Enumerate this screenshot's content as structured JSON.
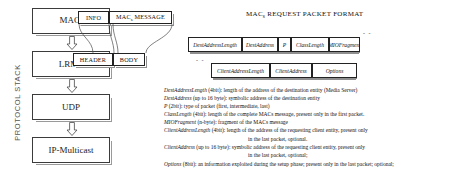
{
  "protocol_stack": {
    "axis_label": "PROTOCOL STACK",
    "nodes": [
      {
        "label": "MACs",
        "base": "MAC",
        "sub": "s"
      },
      {
        "label": "LRMP",
        "base": "LRMP",
        "sub": ""
      },
      {
        "label": "UDP",
        "base": "UDP",
        "sub": ""
      },
      {
        "label": "IP-Multicast",
        "base": "IP-Multicast",
        "sub": ""
      }
    ]
  },
  "message_boxes": {
    "info": "INFO",
    "macs_message_base": "MAC",
    "macs_message_sub": "s",
    "macs_message_tail": " MESSAGE",
    "header": "HEADER",
    "body": "BODY"
  },
  "packet_format": {
    "title_base": "MAC",
    "title_sub": "s",
    "title_tail": " REQUEST PACKET FORMAT",
    "row1": [
      "DestAddressLength",
      "DestAddress",
      "P",
      "ClassLength",
      "MIOFragment"
    ],
    "row2": [
      "ClientAddressLength",
      "ClientAddress",
      "Options"
    ],
    "continuation_marker": "- -"
  },
  "legend": [
    {
      "term": "DestAddressLength",
      "desc": " (4bit): length of the address of the destination entity (Media Server)",
      "cont": ""
    },
    {
      "term": "DestAddress",
      "desc": " (up to 16 byte): symbolic address of the destination entity",
      "cont": ""
    },
    {
      "term": "P",
      "desc": " (2bit): type of packet (first, intermediate, last)",
      "cont": ""
    },
    {
      "term": "ClassLength",
      "desc": " (4bit): length of the complete MACs message, present only in the first packet.",
      "cont": ""
    },
    {
      "term": "MIOFragment",
      "desc": " (n-byte): fragment of the MACs message",
      "cont": ""
    },
    {
      "term": "ClientAddressLength",
      "desc": " (4bit): length of the address of the requesting client entity, present only",
      "cont": "in the last packet, optional."
    },
    {
      "term": "ClientAddress",
      "desc": " (up to 16 byte): symbolic address of the requesting client entity, present only",
      "cont": "in the last packet, optional;"
    },
    {
      "term": "Options",
      "desc": " (8bit): an information exploited during the setup phase; present only in the last packet; optional;",
      "cont": ""
    }
  ],
  "colors": {
    "ink": "#111111",
    "border": "#3b3b3b",
    "shadow": "#8f8f8f",
    "background": "#ffffff",
    "muted": "#555555"
  }
}
